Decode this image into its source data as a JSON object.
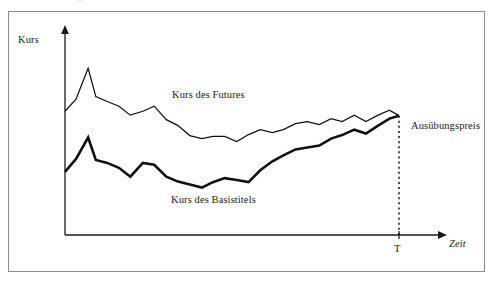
{
  "figure": {
    "caption_remnant": "Abbildung",
    "background_color": "#ffffff",
    "frame_color": "#8c8c8c",
    "ink_color": "#111111"
  },
  "axes": {
    "y_axis_label": "Kurs",
    "x_axis_label": "Zeit",
    "x_tick_label": "T"
  },
  "annotations": {
    "series_future_label": "Kurs des Futures",
    "series_underlying_label": "Kurs des Basistitels",
    "strike_label": "Ausübungspreis"
  },
  "chart_data": {
    "type": "line",
    "title": "",
    "subtitle": "",
    "xlabel": "Zeit",
    "ylabel": "Kurs",
    "xlim": [
      0,
      100
    ],
    "ylim": [
      0,
      100
    ],
    "grid": false,
    "legend": "inline-annotations",
    "x_ticks": [
      {
        "value": 91,
        "label": "T"
      }
    ],
    "y_ticks": [],
    "annotations": [
      {
        "text": "Kurs des Futures",
        "x": 30,
        "y": 72
      },
      {
        "text": "Kurs des Basistitels",
        "x": 30,
        "y": 16
      },
      {
        "text": "Ausübungspreis",
        "x": 94,
        "y": 58
      }
    ],
    "series": [
      {
        "name": "Kurs des Futures",
        "style": "thin",
        "x": [
          0,
          3,
          6.3,
          8.4,
          11.5,
          14.7,
          17.8,
          21.2,
          24.3,
          27.6,
          30.8,
          34,
          37.3,
          40.3,
          43.5,
          46.8,
          50,
          53.2,
          56.5,
          59.5,
          62.8,
          66,
          69.3,
          72.5,
          75.5,
          78.8,
          82,
          85.3,
          88.4,
          91
        ],
        "y": [
          70.7,
          77.6,
          95.3,
          79.1,
          76.3,
          73.6,
          68.5,
          70.7,
          73.6,
          65.9,
          62.5,
          56.8,
          55.1,
          56.3,
          56.3,
          53.4,
          57.4,
          60.2,
          58.5,
          60.2,
          63.6,
          64.8,
          63.1,
          66.5,
          64.8,
          68.5,
          64.8,
          68.5,
          71.3,
          68.2
        ]
      },
      {
        "name": "Kurs des Basistitels",
        "style": "thick",
        "x": [
          0,
          3,
          6.3,
          8.4,
          11.5,
          14.7,
          17.8,
          21.2,
          24.3,
          27.6,
          30.8,
          34,
          37.3,
          40.3,
          43.5,
          46.8,
          50,
          53.2,
          56.5,
          59.5,
          62.8,
          66,
          69.3,
          72.5,
          75.5,
          78.8,
          82,
          85.3,
          88.4,
          91
        ],
        "y": [
          36.1,
          43.5,
          55.7,
          42.9,
          41.2,
          38.4,
          33.3,
          41.2,
          40.1,
          33.3,
          30.5,
          28.8,
          27.1,
          30.2,
          32.5,
          31.4,
          30.2,
          37.0,
          42.1,
          45.5,
          48.9,
          50.0,
          51.1,
          55.1,
          57.1,
          60.2,
          58.0,
          62.5,
          66.5,
          68.2
        ]
      }
    ],
    "reference_lines": [
      {
        "name": "expiry-line",
        "orientation": "vertical",
        "x": 91,
        "label": "T",
        "style": "dotted",
        "from_y": 0,
        "to_y": 68.2
      }
    ]
  }
}
